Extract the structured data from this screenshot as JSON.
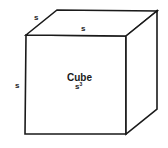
{
  "diagram": {
    "title": "Cube",
    "formula_base": "s",
    "formula_exponent": "3",
    "edge_labels": {
      "top_diagonal": "s",
      "top_front": "s",
      "left_side": "s"
    },
    "colors": {
      "stroke": "#1a1a1a",
      "background": "#ffffff"
    }
  }
}
